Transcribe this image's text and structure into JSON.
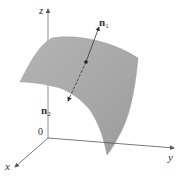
{
  "diagram": {
    "type": "3d-surface-with-normals",
    "axes": {
      "x_label": "x",
      "y_label": "y",
      "z_label": "z",
      "origin_label": "0"
    },
    "normals": [
      {
        "base": "n",
        "subscript": "1"
      },
      {
        "base": "n",
        "subscript": "2"
      }
    ],
    "colors": {
      "surface_fill": "#a8a8a8",
      "surface_highlight": "#c4c4c4",
      "axis_stroke": "#666666",
      "normal_stroke": "#333333",
      "background": "#ffffff"
    }
  }
}
